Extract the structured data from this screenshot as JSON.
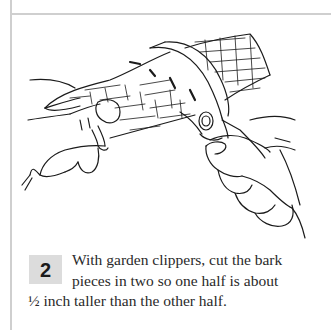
{
  "step": {
    "number": "2",
    "lines": [
      "With garden clippers, cut the bark",
      "pieces in two so one half is about",
      "½ inch taller than the other half."
    ]
  },
  "illustration": {
    "subject": "hands-cutting-bark-with-garden-clippers-icon",
    "description": "Line drawing of two hands holding a curled piece of bark while garden clippers cut through it"
  },
  "colors": {
    "rule_lines": "#cfcfcf",
    "badge_background": "#dcdcdc",
    "text": "#2a2a2a"
  }
}
